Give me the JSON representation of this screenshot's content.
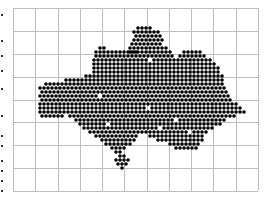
{
  "chart_data": {
    "type": "scatter",
    "title": "",
    "xlabel": "",
    "ylabel": "",
    "grid": true,
    "legend": null,
    "plot_area": {
      "x0": 13,
      "y0": 8,
      "x1": 258,
      "y1": 191
    },
    "grid_columns": 11,
    "grid_rows": 8,
    "grid_color": "#bdbdbd",
    "marker": {
      "shape": "circle",
      "color": "#000000",
      "diameter": 3.6,
      "lattice_spacing": 4
    },
    "cluster_rows": [
      {
        "y": 28,
        "ranges": [
          [
            138,
            150
          ]
        ]
      },
      {
        "y": 32,
        "ranges": [
          [
            134,
            158
          ]
        ]
      },
      {
        "y": 36,
        "ranges": [
          [
            136,
            160
          ]
        ]
      },
      {
        "y": 40,
        "ranges": [
          [
            134,
            162
          ]
        ]
      },
      {
        "y": 44,
        "ranges": [
          [
            132,
            162
          ]
        ]
      },
      {
        "y": 48,
        "ranges": [
          [
            100,
            104
          ],
          [
            130,
            166
          ]
        ]
      },
      {
        "y": 52,
        "ranges": [
          [
            96,
            136
          ],
          [
            130,
            170
          ],
          [
            184,
            200
          ]
        ]
      },
      {
        "y": 56,
        "ranges": [
          [
            96,
            172
          ],
          [
            180,
            206
          ]
        ]
      },
      {
        "y": 60,
        "ranges": [
          [
            94,
            210
          ]
        ]
      },
      {
        "y": 64,
        "ranges": [
          [
            94,
            216
          ]
        ]
      },
      {
        "y": 68,
        "ranges": [
          [
            94,
            220
          ]
        ]
      },
      {
        "y": 72,
        "ranges": [
          [
            94,
            220
          ]
        ]
      },
      {
        "y": 76,
        "ranges": [
          [
            86,
            222
          ]
        ]
      },
      {
        "y": 80,
        "ranges": [
          [
            66,
            222
          ]
        ]
      },
      {
        "y": 84,
        "ranges": [
          [
            46,
            224
          ]
        ]
      },
      {
        "y": 88,
        "ranges": [
          [
            40,
            224
          ]
        ]
      },
      {
        "y": 92,
        "ranges": [
          [
            42,
            226
          ]
        ]
      },
      {
        "y": 96,
        "ranges": [
          [
            40,
            228
          ]
        ]
      },
      {
        "y": 100,
        "ranges": [
          [
            42,
            230
          ]
        ]
      },
      {
        "y": 104,
        "ranges": [
          [
            40,
            236
          ]
        ]
      },
      {
        "y": 108,
        "ranges": [
          [
            40,
            240
          ]
        ]
      },
      {
        "y": 112,
        "ranges": [
          [
            40,
            244
          ]
        ]
      },
      {
        "y": 116,
        "ranges": [
          [
            42,
            62
          ],
          [
            70,
            236
          ]
        ]
      },
      {
        "y": 120,
        "ranges": [
          [
            76,
            226
          ]
        ]
      },
      {
        "y": 124,
        "ranges": [
          [
            80,
            220
          ]
        ]
      },
      {
        "y": 128,
        "ranges": [
          [
            84,
            214
          ]
        ]
      },
      {
        "y": 132,
        "ranges": [
          [
            90,
            208
          ]
        ]
      },
      {
        "y": 136,
        "ranges": [
          [
            96,
            138
          ],
          [
            150,
            204
          ]
        ]
      },
      {
        "y": 140,
        "ranges": [
          [
            102,
            134
          ],
          [
            158,
            202
          ]
        ]
      },
      {
        "y": 144,
        "ranges": [
          [
            106,
            130
          ],
          [
            170,
            200
          ]
        ]
      },
      {
        "y": 148,
        "ranges": [
          [
            112,
            124
          ],
          [
            176,
            196
          ]
        ]
      },
      {
        "y": 152,
        "ranges": [
          [
            116,
            120
          ]
        ]
      },
      {
        "y": 156,
        "ranges": [
          [
            120,
            124
          ]
        ]
      },
      {
        "y": 160,
        "ranges": [
          [
            116,
            128
          ]
        ]
      },
      {
        "y": 164,
        "ranges": [
          [
            118,
            126
          ]
        ]
      },
      {
        "y": 168,
        "ranges": [
          [
            122,
            124
          ]
        ]
      }
    ],
    "holes": [
      [
        100,
        96
      ],
      [
        124,
        100
      ],
      [
        148,
        108
      ],
      [
        176,
        120
      ],
      [
        108,
        124
      ],
      [
        160,
        128
      ],
      [
        190,
        132
      ],
      [
        86,
        104
      ],
      [
        200,
        92
      ],
      [
        150,
        60
      ]
    ],
    "left_edge_marks_y": [
      14,
      40,
      55,
      70,
      88,
      115,
      135,
      145,
      160,
      170,
      180,
      190
    ]
  }
}
